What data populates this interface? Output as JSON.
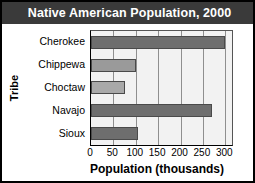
{
  "chart_data": {
    "type": "bar",
    "orientation": "horizontal",
    "title": "Native American Population, 2000",
    "xlabel": "Population (thousands)",
    "ylabel": "Tribe",
    "categories": [
      "Cherokee",
      "Chippewa",
      "Choctaw",
      "Navajo",
      "Sioux"
    ],
    "values": [
      300,
      100,
      75,
      270,
      105
    ],
    "xlim": [
      0,
      315
    ],
    "xticks": [
      0,
      50,
      100,
      150,
      200,
      250,
      300
    ],
    "xtick_labels": [
      "0",
      "50",
      "100",
      "150",
      "200",
      "250",
      "300"
    ],
    "grid": "vertical",
    "legend": "none",
    "bar_colors": [
      "#6e6e6e",
      "#9a9a9a",
      "#a9a9a9",
      "#6e6e6e",
      "#6e6e6e"
    ],
    "series": [
      {
        "name": "Population (thousands)",
        "points": [
          {
            "category": "Cherokee",
            "value": 300
          },
          {
            "category": "Chippewa",
            "value": 100
          },
          {
            "category": "Choctaw",
            "value": 75
          },
          {
            "category": "Navajo",
            "value": 270
          },
          {
            "category": "Sioux",
            "value": 105
          }
        ]
      }
    ]
  },
  "style": {
    "title_background": "#3a3a3a",
    "title_color": "#ffffff",
    "plot_background": "#f2f2f2",
    "gridline_color": "#8f8f8f",
    "axis_color": "#000000"
  }
}
